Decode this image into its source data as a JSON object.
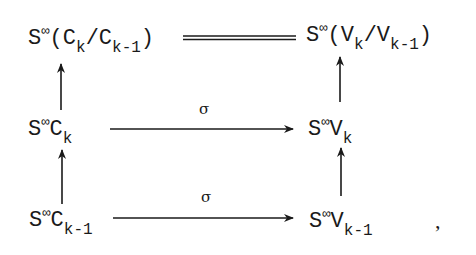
{
  "diagram": {
    "type": "commutative-diagram",
    "nodes": {
      "top_left": {
        "base": "S",
        "sup": "∞",
        "text": "(C",
        "sub1": "k",
        "mid": "/C",
        "sub2": "k-1",
        "end": ")"
      },
      "top_right": {
        "base": "S",
        "sup": "∞",
        "text": "(V",
        "sub1": "k",
        "mid": "/V",
        "sub2": "k-1",
        "end": ")"
      },
      "mid_left": {
        "base": "S",
        "sup": "∞",
        "text": "C",
        "sub1": "k"
      },
      "mid_right": {
        "base": "S",
        "sup": "∞",
        "text": "V",
        "sub1": "k"
      },
      "bot_left": {
        "base": "S",
        "sup": "∞",
        "text": "C",
        "sub1": "k-1"
      },
      "bot_right": {
        "base": "S",
        "sup": "∞",
        "text": "V",
        "sub1": "k-1"
      }
    },
    "edges": [
      {
        "from": "top_left",
        "to": "top_right",
        "style": "double-line",
        "label": ""
      },
      {
        "from": "mid_left",
        "to": "mid_right",
        "style": "arrow",
        "label": "σ"
      },
      {
        "from": "bot_left",
        "to": "bot_right",
        "style": "arrow",
        "label": "σ"
      },
      {
        "from": "mid_left",
        "to": "top_left",
        "style": "arrow",
        "label": ""
      },
      {
        "from": "bot_left",
        "to": "mid_left",
        "style": "arrow",
        "label": ""
      },
      {
        "from": "mid_right",
        "to": "top_right",
        "style": "arrow",
        "label": ""
      },
      {
        "from": "bot_right",
        "to": "mid_right",
        "style": "arrow",
        "label": ""
      }
    ],
    "trailing_punctuation": ","
  }
}
